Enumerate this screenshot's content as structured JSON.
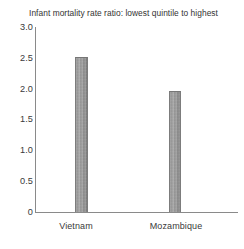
{
  "chart_data": {
    "type": "bar",
    "title": "Infant mortality rate ratio: lowest quintile to highest",
    "xlabel": "",
    "ylabel": "",
    "categories": [
      "Vietnam",
      "Mozambique"
    ],
    "values": [
      2.52,
      1.97
    ],
    "ylim": [
      0,
      3.0
    ],
    "yticks": [
      0,
      0.5,
      1.0,
      1.5,
      2.0,
      2.5,
      3.0
    ],
    "ytick_labels": [
      "0",
      "0.5",
      "1.0",
      "1.5",
      "2.0",
      "2.5",
      "3.0"
    ],
    "grid": false,
    "legend": false,
    "legend_position": "none",
    "bar_color": "#9a9a9a",
    "axis_color": "#8a8a8a",
    "text_color": "#333333",
    "series": [
      {
        "name": "Infant mortality rate ratio",
        "values": [
          2.52,
          1.97
        ]
      }
    ]
  },
  "title": {
    "text": "Infant mortality rate ratio: lowest quintile to highest"
  },
  "y_axis": {
    "ticks": [
      {
        "label": "3.0",
        "value": 3.0
      },
      {
        "label": "2.5",
        "value": 2.5
      },
      {
        "label": "2.0",
        "value": 2.0
      },
      {
        "label": "1.5",
        "value": 1.5
      },
      {
        "label": "1.0",
        "value": 1.0
      },
      {
        "label": "0.5",
        "value": 0.5
      },
      {
        "label": "0",
        "value": 0.0
      }
    ]
  },
  "x_axis": {
    "categories": [
      {
        "label": "Vietnam"
      },
      {
        "label": "Mozambique"
      }
    ]
  },
  "bars": [
    {
      "category": "Vietnam",
      "value": 2.52
    },
    {
      "category": "Mozambique",
      "value": 1.97
    }
  ]
}
